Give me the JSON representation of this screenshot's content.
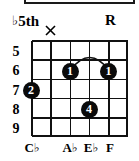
{
  "diagram": {
    "type": "guitar-chord-diagram",
    "instrument": "guitar",
    "strings": 6,
    "frets_shown": 5,
    "accent_color": "#000000",
    "background_color": "#ffffff"
  },
  "top_labels": [
    {
      "text": "5th",
      "accidental": "♭",
      "string_index": 1,
      "name": "flat-fifth"
    },
    {
      "text": "R",
      "accidental": "",
      "string_index": 6,
      "name": "root"
    }
  ],
  "mutes": [
    {
      "marker": "×",
      "string_index": 2
    }
  ],
  "fret_numbers": [
    "5",
    "6",
    "7",
    "8",
    "9"
  ],
  "dots": [
    {
      "finger": "2",
      "string_index": 1,
      "fret": 7
    },
    {
      "finger": "1",
      "string_index": 3,
      "fret": 6
    },
    {
      "finger": "1",
      "string_index": 5,
      "fret": 6
    },
    {
      "finger": "4",
      "string_index": 4,
      "fret": 8
    }
  ],
  "barre": {
    "finger": "1",
    "fret": 6,
    "from_string": 3,
    "to_string": 5,
    "style": "arc"
  },
  "note_names": [
    {
      "letter": "C",
      "accidental": "♭",
      "string_index": 1
    },
    {
      "letter": "A",
      "accidental": "♭",
      "string_index": 3
    },
    {
      "letter": "E",
      "accidental": "♭",
      "string_index": 4
    },
    {
      "letter": "F",
      "accidental": "",
      "string_index": 5
    }
  ]
}
